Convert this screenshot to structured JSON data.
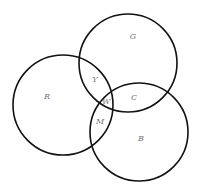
{
  "diagram": {
    "type": "venn-3-circle",
    "circles": [
      {
        "name": "G",
        "cx": 128,
        "cy": 63,
        "r": 49
      },
      {
        "name": "R",
        "cx": 63,
        "cy": 105,
        "r": 50
      },
      {
        "name": "B",
        "cx": 139,
        "cy": 132,
        "r": 49
      }
    ],
    "labels": [
      {
        "text": "G",
        "x": 133,
        "y": 37
      },
      {
        "text": "Y",
        "x": 95,
        "y": 80
      },
      {
        "text": "R",
        "x": 47,
        "y": 97
      },
      {
        "text": "W",
        "x": 106,
        "y": 102
      },
      {
        "text": "C",
        "x": 134,
        "y": 98
      },
      {
        "text": "M",
        "x": 100,
        "y": 122
      },
      {
        "text": "B",
        "x": 141,
        "y": 139
      }
    ]
  }
}
